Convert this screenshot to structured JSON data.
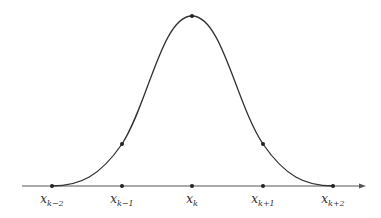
{
  "diagram": {
    "type": "bell-shaped basis function (cubic B-spline)",
    "axis": {
      "x_start": 22,
      "x_end": 366,
      "y": 186,
      "arrow": true,
      "color": "#555555"
    },
    "curve_color": "#333333",
    "nodes": [
      {
        "label_base": "x",
        "label_sub": "k−2",
        "x": 52
      },
      {
        "label_base": "x",
        "label_sub": "k−1",
        "x": 122
      },
      {
        "label_base": "x",
        "label_sub": "k",
        "x": 192
      },
      {
        "label_base": "x",
        "label_sub": "k+1",
        "x": 263
      },
      {
        "label_base": "x",
        "label_sub": "k+2",
        "x": 333
      }
    ],
    "curve_points": [
      {
        "x": 122,
        "y": 144
      },
      {
        "x": 192,
        "y": 16
      },
      {
        "x": 263,
        "y": 144
      }
    ]
  }
}
